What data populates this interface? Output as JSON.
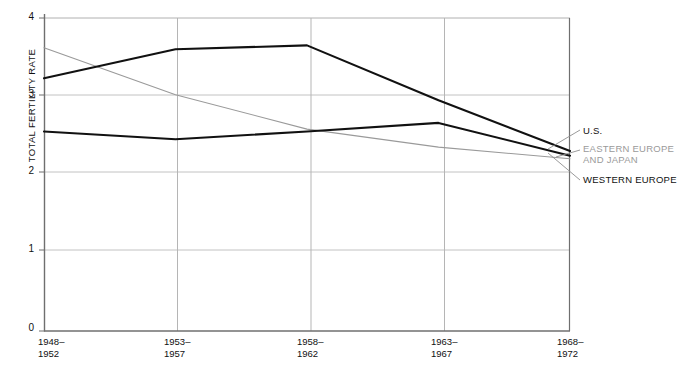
{
  "chart_data": {
    "type": "line",
    "title": "",
    "xlabel": "",
    "ylabel": "TOTAL FERTILITY RATE",
    "categories": [
      "1948–\n1952",
      "1953–\n1957",
      "1958–\n1962",
      "1963–\n1967",
      "1968–\n1972"
    ],
    "x_tick_lines": [
      [
        "1948–",
        "1952"
      ],
      [
        "1953–",
        "1957"
      ],
      [
        "1958–",
        "1962"
      ],
      [
        "1963–",
        "1967"
      ],
      [
        "1968–",
        "1972"
      ]
    ],
    "y_ticks": [
      "0",
      "1",
      "2",
      "3",
      "4"
    ],
    "ylim": [
      0,
      4
    ],
    "grid": true,
    "legend_position": "right-inline-labels",
    "series": [
      {
        "name": "U.S.",
        "color": "#111111",
        "width": 2.1,
        "values": [
          3.23,
          3.6,
          3.65,
          2.95,
          2.3
        ]
      },
      {
        "name": "EASTERN EUROPE AND JAPAN",
        "color": "#9a9a9a",
        "width": 1.1,
        "values": [
          3.62,
          3.02,
          2.58,
          2.35,
          2.2
        ]
      },
      {
        "name": "WESTERN EUROPE",
        "color": "#111111",
        "width": 2.1,
        "values": [
          2.55,
          2.45,
          2.55,
          2.66,
          2.24
        ]
      }
    ]
  },
  "legend": {
    "us": "U.S.",
    "eastern_line1": "EASTERN EUROPE",
    "eastern_line2": "AND JAPAN",
    "western": "WESTERN EUROPE"
  },
  "axis": {
    "y_title": "TOTAL FERTILITY RATE",
    "y_tick_0": "0",
    "y_tick_1": "1",
    "y_tick_2": "2",
    "y_tick_3": "3",
    "y_tick_4": "4"
  },
  "colors": {
    "line_dark": "#111111",
    "line_gray": "#9a9a9a",
    "grid": "#b9b9b9",
    "axis": "#6f6f6f",
    "background": "#ffffff"
  }
}
